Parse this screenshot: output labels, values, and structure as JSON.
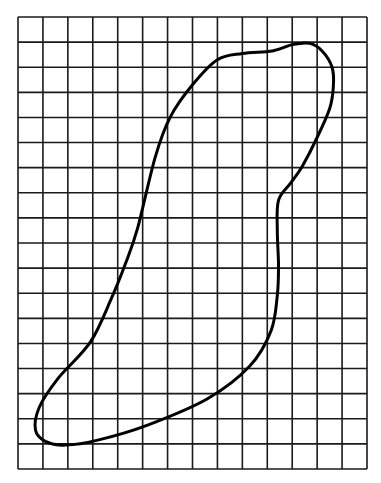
{
  "figure": {
    "type": "grid-with-closed-curve",
    "grid": {
      "columns": 14,
      "rows": 18,
      "line_color": "#1a1a1a"
    },
    "outline": {
      "color": "#000000",
      "points_grid_units": [
        [
          5.5,
          5.6
        ],
        [
          6.1,
          4.0
        ],
        [
          7.0,
          2.7
        ],
        [
          8.0,
          1.7
        ],
        [
          9.0,
          1.45
        ],
        [
          10.2,
          1.35
        ],
        [
          11.0,
          1.1
        ],
        [
          11.7,
          1.05
        ],
        [
          12.2,
          1.35
        ],
        [
          12.6,
          2.0
        ],
        [
          12.65,
          2.8
        ],
        [
          12.5,
          3.65
        ],
        [
          12.0,
          4.8
        ],
        [
          11.4,
          5.95
        ],
        [
          10.95,
          6.6
        ],
        [
          10.45,
          7.3
        ],
        [
          10.4,
          8.5
        ],
        [
          10.45,
          9.9
        ],
        [
          10.4,
          11.1
        ],
        [
          10.15,
          12.5
        ],
        [
          9.3,
          13.9
        ],
        [
          7.6,
          15.2
        ],
        [
          5.2,
          16.25
        ],
        [
          3.2,
          16.85
        ],
        [
          1.9,
          17.05
        ],
        [
          1.1,
          16.9
        ],
        [
          0.7,
          16.45
        ],
        [
          0.85,
          15.55
        ],
        [
          1.6,
          14.4
        ],
        [
          2.9,
          12.95
        ],
        [
          3.75,
          11.2
        ],
        [
          4.3,
          9.85
        ],
        [
          4.8,
          8.4
        ]
      ]
    }
  }
}
